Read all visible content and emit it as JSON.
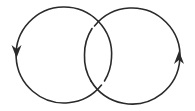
{
  "diagram": {
    "type": "link-diagram",
    "description": "Two interlocking oriented circles (Hopf link)",
    "stroke_color": "#2a2a2a",
    "background": "#ffffff",
    "components": [
      {
        "name": "left-circle",
        "center": [
          64,
          55
        ],
        "radius": 48,
        "orientation": "counterclockwise",
        "arrow": {
          "position": [
            17,
            55
          ],
          "direction": "down"
        }
      },
      {
        "name": "right-circle",
        "center": [
          132,
          55
        ],
        "radius": 48,
        "orientation": "counterclockwise",
        "arrow": {
          "position": [
            179,
            55
          ],
          "direction": "up"
        }
      }
    ],
    "crossings": [
      {
        "location": "top",
        "over": "left-circle",
        "under": "right-circle"
      },
      {
        "location": "bottom",
        "over": "right-circle",
        "under": "left-circle"
      }
    ]
  }
}
